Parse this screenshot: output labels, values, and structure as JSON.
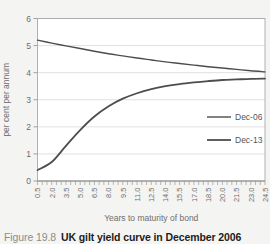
{
  "figure": {
    "caption_label": "Figure 19.8",
    "caption_title": "UK gilt yield curve in December 2006"
  },
  "colors": {
    "background": "#f4f4f2",
    "plot_background": "#ffffff",
    "gridline": "#d9d9d9",
    "plot_border": "#a8a8a8",
    "axis": "#8c8c8c",
    "tick_text": "#6e6e6e",
    "axis_title_text": "#6e6e6e",
    "legend_text": "#555555",
    "line": "#4d4d4d",
    "caption_label": "#8c8c8c",
    "caption_title": "#1c1c1c"
  },
  "chart_data": {
    "type": "line",
    "title": "",
    "xlabel": "Years to maturity of bond",
    "ylabel": "per cent per annum",
    "x_range": [
      0.5,
      24.5
    ],
    "ylim": [
      0,
      6
    ],
    "yticks": [
      0,
      1,
      2,
      3,
      4,
      5,
      6
    ],
    "x_minor_tick_step": 0.5,
    "grid": true,
    "legend_position": "right-inside",
    "x": [
      0.5,
      2.0,
      3.5,
      5.0,
      6.5,
      8.0,
      9.5,
      11.0,
      12.5,
      14.0,
      15.5,
      17.0,
      18.5,
      20.0,
      21.5,
      23.0,
      24.5
    ],
    "xtick_labels": [
      "0.5",
      "2.0",
      "3.5",
      "5.0",
      "6.5",
      "8.0",
      "9.5",
      "11.0",
      "12.5",
      "14.0",
      "15.5",
      "17.0",
      "18.5",
      "20.0",
      "21.5",
      "23.0",
      "24.5"
    ],
    "series": [
      {
        "name": "Dec-06",
        "color": "#4d4d4d",
        "width": 1.4,
        "values": [
          5.2,
          5.09,
          4.99,
          4.89,
          4.79,
          4.7,
          4.62,
          4.54,
          4.47,
          4.4,
          4.34,
          4.28,
          4.22,
          4.17,
          4.12,
          4.07,
          4.03
        ]
      },
      {
        "name": "Dec-13",
        "color": "#4d4d4d",
        "width": 1.8,
        "values": [
          0.4,
          0.7,
          1.3,
          1.88,
          2.38,
          2.76,
          3.04,
          3.24,
          3.39,
          3.5,
          3.58,
          3.64,
          3.69,
          3.73,
          3.75,
          3.77,
          3.78
        ]
      }
    ]
  }
}
